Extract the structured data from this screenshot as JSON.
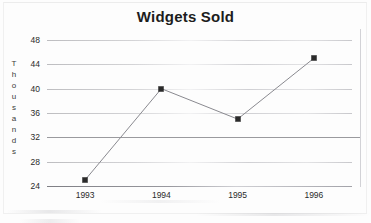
{
  "chart_data": {
    "type": "line",
    "title": "Widgets Sold",
    "xlabel": "",
    "ylabel": "Thousands",
    "categories": [
      "1993",
      "1994",
      "1995",
      "1996"
    ],
    "values": [
      25,
      40,
      35,
      45
    ],
    "series": [
      {
        "name": "Widgets Sold",
        "values": [
          25,
          40,
          35,
          45
        ]
      }
    ],
    "ylim": [
      24,
      48
    ],
    "yticks": [
      24,
      28,
      32,
      36,
      40,
      44,
      48
    ],
    "ytick_labels": [
      "24",
      "28",
      "32",
      "36",
      "40",
      "44",
      "48"
    ],
    "grid": true,
    "legend": "none",
    "marker": "square",
    "marker_color": "#2a2a2a",
    "line_color": "#8a8a90"
  },
  "axis": {
    "y_title_letters": [
      "T",
      "h",
      "o",
      "u",
      "s",
      "a",
      "n",
      "d",
      "s"
    ]
  },
  "colors": {
    "title_text": "#1d1d1d",
    "tick_text": "#2b2b2b",
    "gridline": "#b4b4b8",
    "gridline_strong": "#9a9a9e",
    "marker": "#2a2a2a",
    "line": "#8a8a90",
    "background": "#fdfdfd"
  }
}
